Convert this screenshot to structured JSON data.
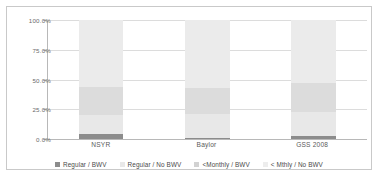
{
  "chart_data": {
    "type": "bar",
    "subtype": "stacked-100-percent",
    "title": "",
    "xlabel": "",
    "ylabel": "",
    "categories": [
      "NSYR",
      "Baylor",
      "GSS 2008"
    ],
    "ylim": [
      0,
      100
    ],
    "ytick_labels": [
      "0.0%",
      "25.0%",
      "50.0%",
      "75.0%",
      "100.0%"
    ],
    "ytick_values": [
      0,
      25,
      50,
      75,
      100
    ],
    "grid": true,
    "legend_position": "bottom",
    "series": [
      {
        "name": "Regular / BWV",
        "color": "#8c8c8c",
        "values": [
          4.0,
          1.0,
          2.5
        ]
      },
      {
        "name": "Regular / No BWV",
        "color": "#e8e8e8",
        "values": [
          16.0,
          20.0,
          20.5
        ]
      },
      {
        "name": "<Monthly / BWV",
        "color": "#dcdcdc",
        "values": [
          24.0,
          22.0,
          24.0
        ]
      },
      {
        "name": "< Mthly / No BWV",
        "color": "#ebebeb",
        "values": [
          56.0,
          57.0,
          53.0
        ]
      }
    ]
  },
  "legend": {
    "items": [
      {
        "label": "Regular / BWV",
        "color": "#8c8c8c"
      },
      {
        "label": "Regular / No BWV",
        "color": "#e8e8e8"
      },
      {
        "label": "<Monthly / BWV",
        "color": "#d2d2d2"
      },
      {
        "label": "< Mthly / No BWV",
        "color": "#ededed"
      }
    ]
  },
  "colors": {
    "frame_border": "#c9c9c9",
    "gridline": "#dcdcdc",
    "axis_line": "#b8b8b8",
    "tick_text": "#6b6b6b",
    "category_text": "#5a5a5a",
    "legend_text": "#4a4a4a",
    "plot_background": "#ffffff"
  }
}
